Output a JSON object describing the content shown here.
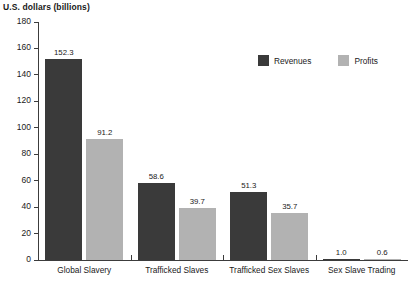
{
  "chart_data": {
    "type": "bar",
    "title": "",
    "ylabel": "U.S. dollars (billions)",
    "xlabel": "",
    "ylim": [
      0,
      180
    ],
    "yticks": [
      0,
      20,
      40,
      60,
      80,
      100,
      120,
      140,
      160,
      180
    ],
    "grid": false,
    "legend_position": "top-right",
    "categories": [
      "Global Slavery",
      "Trafficked Slaves",
      "Trafficked Sex Slaves",
      "Sex Slave Trading"
    ],
    "series": [
      {
        "name": "Revenues",
        "color": "#3a3a3a",
        "values": [
          152.3,
          58.6,
          51.3,
          1.0
        ],
        "labels": [
          "152.3",
          "58.6",
          "51.3",
          "1.0"
        ]
      },
      {
        "name": "Profits",
        "color": "#b2b2b2",
        "values": [
          91.2,
          39.7,
          35.7,
          0.6
        ],
        "labels": [
          "91.2",
          "39.7",
          "35.7",
          "0.6"
        ]
      }
    ]
  },
  "colors": {
    "revenues": "#3a3a3a",
    "profits": "#b2b2b2",
    "axis": "#3c3c3c",
    "background": "#ffffff"
  }
}
